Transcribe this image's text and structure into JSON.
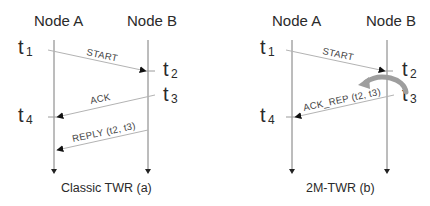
{
  "colors": {
    "text": "#2a2a2a",
    "lifeline": "#7a7a7a",
    "message": "#b3b3b3",
    "arrowhead": "#111111",
    "curved_arrow": "#9e9e9e"
  },
  "diagrams": [
    {
      "caption": "Classic TWR (a)",
      "node_a": "Node A",
      "node_b": "Node B",
      "timestamps": [
        {
          "t": "t",
          "sub": "1"
        },
        {
          "t": "t",
          "sub": "2"
        },
        {
          "t": "t",
          "sub": "3"
        },
        {
          "t": "t",
          "sub": "4"
        }
      ],
      "messages": [
        {
          "label": "START",
          "from": "Node A",
          "to": "Node B"
        },
        {
          "label": "ACK",
          "from": "Node B",
          "to": "Node A"
        },
        {
          "label": "REPLY (t2, t3)",
          "from": "Node B",
          "to": "Node A"
        }
      ]
    },
    {
      "caption": "2M-TWR (b)",
      "node_a": "Node A",
      "node_b": "Node B",
      "timestamps": [
        {
          "t": "t",
          "sub": "1"
        },
        {
          "t": "t",
          "sub": "2"
        },
        {
          "t": "t",
          "sub": "3"
        },
        {
          "t": "t",
          "sub": "4"
        }
      ],
      "messages": [
        {
          "label": "START",
          "from": "Node A",
          "to": "Node B"
        },
        {
          "label": "ACK_REP (t2, t3)",
          "from": "Node B",
          "to": "Node A"
        }
      ],
      "annotation": "curved-arrow t2 to t3"
    }
  ]
}
